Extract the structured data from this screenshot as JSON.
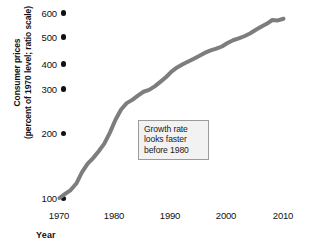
{
  "chart_data": {
    "type": "line",
    "title": "",
    "xlabel": "Year",
    "ylabel_line1": "Consumer prices",
    "ylabel_line2": "(percent of 1970 level; ratio scale)",
    "scale": "log",
    "grid": false,
    "legend": "none",
    "xlim": [
      1970,
      2010
    ],
    "ylim": [
      80,
      620
    ],
    "xticks": [
      1970,
      1980,
      1990,
      2000,
      2010
    ],
    "xtick_labels": [
      "1970",
      "1980",
      "1990",
      "2000",
      "2010"
    ],
    "yticks": [
      100,
      200,
      300,
      400,
      500,
      600
    ],
    "ytick_labels": [
      "100",
      "200",
      "300",
      "400",
      "500",
      "600"
    ],
    "series_name": "Consumer prices",
    "line_color": "#7d7d7d",
    "line_width": 4,
    "x": [
      1970,
      1971,
      1972,
      1973,
      1974,
      1975,
      1976,
      1977,
      1978,
      1979,
      1980,
      1981,
      1982,
      1983,
      1984,
      1985,
      1986,
      1987,
      1988,
      1989,
      1990,
      1991,
      1992,
      1993,
      1994,
      1995,
      1996,
      1997,
      1998,
      1999,
      2000,
      2001,
      2002,
      2003,
      2004,
      2005,
      2006,
      2007,
      2008,
      2009,
      2010
    ],
    "values": [
      100,
      104,
      108,
      115,
      128,
      139,
      147,
      157,
      169,
      188,
      213,
      235,
      250,
      258,
      269,
      279,
      284,
      294,
      307,
      321,
      339,
      353,
      364,
      374,
      384,
      395,
      407,
      416,
      423,
      432,
      447,
      459,
      467,
      477,
      490,
      507,
      523,
      538,
      558,
      556,
      565
    ],
    "annotation": {
      "line1": "Growth rate",
      "line2": "looks faster",
      "line3": "before 1980"
    }
  }
}
